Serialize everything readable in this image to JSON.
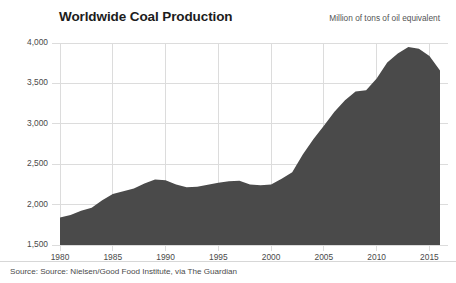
{
  "chart_data": {
    "type": "area",
    "title": "Worldwide Coal Production",
    "subtitle": "Million of tons of oil equivalent",
    "xlabel": "",
    "ylabel": "",
    "ylim": [
      1500,
      4000
    ],
    "xlim": [
      1980,
      2016
    ],
    "grid": true,
    "legend": null,
    "fill_color": "#4a4a4a",
    "grid_color": "#dcdcdc",
    "yticks": [
      "1,500",
      "2,000",
      "2,500",
      "3,000",
      "3,500",
      "4,000"
    ],
    "ytick_values": [
      1500,
      2000,
      2500,
      3000,
      3500,
      4000
    ],
    "xticks": [
      "1980",
      "1985",
      "1990",
      "1995",
      "2000",
      "2005",
      "2010",
      "2015"
    ],
    "xtick_values": [
      1980,
      1985,
      1990,
      1995,
      2000,
      2005,
      2010,
      2015
    ],
    "x": [
      1980,
      1981,
      1982,
      1983,
      1984,
      1985,
      1986,
      1987,
      1988,
      1989,
      1990,
      1991,
      1992,
      1993,
      1994,
      1995,
      1996,
      1997,
      1998,
      1999,
      2000,
      2001,
      2002,
      2003,
      2004,
      2005,
      2006,
      2007,
      2008,
      2009,
      2010,
      2011,
      2012,
      2013,
      2014,
      2015,
      2016
    ],
    "values": [
      1840,
      1870,
      1925,
      1960,
      2055,
      2130,
      2165,
      2200,
      2260,
      2310,
      2300,
      2250,
      2215,
      2220,
      2245,
      2270,
      2290,
      2295,
      2250,
      2240,
      2250,
      2320,
      2400,
      2620,
      2810,
      2975,
      3150,
      3290,
      3400,
      3415,
      3560,
      3760,
      3870,
      3950,
      3930,
      3840,
      3660
    ],
    "source": "Source: Source: Nielsen/Good Food Institute, via The Guardian"
  }
}
